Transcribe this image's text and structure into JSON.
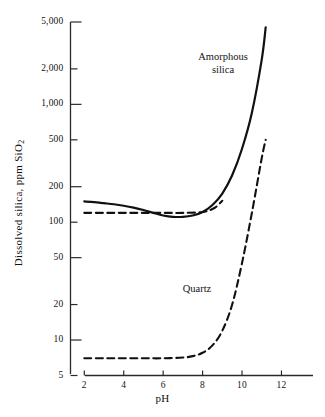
{
  "chart_data": {
    "type": "line",
    "title": "",
    "xlabel": "pH",
    "ylabel": "Dissolved silica, ppm SiO2",
    "ylabel_html": "Dissolved silica, ppm SiO<sub>2</sub>",
    "yscale": "log",
    "xscale": "linear",
    "xlim": [
      1.3,
      13.6
    ],
    "ylim": [
      5,
      5000
    ],
    "grid": false,
    "legend_position": "inline-annotations",
    "xticks": [
      2,
      4,
      6,
      8,
      10,
      12
    ],
    "xtick_labels": [
      "2",
      "4",
      "6",
      "8",
      "10",
      "12"
    ],
    "yticks": [
      5,
      10,
      20,
      50,
      100,
      200,
      500,
      1000,
      2000,
      5000
    ],
    "ytick_labels": [
      "5",
      "10",
      "20",
      "50",
      "100",
      "200",
      "500",
      "1,000",
      "2,000",
      "5,000"
    ],
    "series": [
      {
        "name": "Amorphous silica",
        "style": "solid",
        "color": "#111111",
        "x": [
          2.0,
          2.5,
          3.0,
          3.5,
          4.0,
          4.5,
          5.0,
          5.5,
          6.0,
          6.5,
          7.0,
          7.5,
          8.0,
          8.5,
          9.0,
          9.5,
          10.0,
          10.5,
          11.0,
          11.2
        ],
        "y": [
          150,
          148,
          145,
          142,
          138,
          133,
          127,
          120,
          114,
          111,
          111,
          114,
          122,
          140,
          175,
          250,
          420,
          850,
          2400,
          4500
        ]
      },
      {
        "name": "Quartz",
        "style": "dashed",
        "color": "#111111",
        "x": [
          2.0,
          3.0,
          4.0,
          5.0,
          6.0,
          7.0,
          7.5,
          8.0,
          8.5,
          9.0,
          9.5,
          10.0,
          10.5,
          11.0,
          11.2
        ],
        "y": [
          7,
          7,
          7,
          7,
          7,
          7.1,
          7.3,
          7.8,
          9.0,
          12,
          20,
          45,
          120,
          350,
          500
        ]
      },
      {
        "name": "Amorphous silica (dashed overlay)",
        "style": "dashed",
        "color": "#111111",
        "x": [
          2.0,
          3.0,
          4.0,
          5.0,
          6.0,
          7.0,
          8.0,
          8.6,
          9.0
        ],
        "y": [
          120,
          120,
          120,
          120,
          120,
          120,
          122,
          132,
          152
        ]
      }
    ],
    "annotations": [
      {
        "text": "Amorphous silica",
        "x": 9.6,
        "y": 2100
      },
      {
        "text": "Quartz",
        "x": 8.2,
        "y": 32
      }
    ]
  },
  "axes": {
    "y_title_line": "Dissolved silica, ppm SiO",
    "y_title_sub": "2",
    "x_title": "pH"
  },
  "labels": {
    "amorphous_line1": "Amorphous",
    "amorphous_line2": "silica",
    "quartz": "Quartz"
  },
  "colors": {
    "background": "#ffffff",
    "ink": "#111111",
    "axis": "#2a2a2a"
  }
}
